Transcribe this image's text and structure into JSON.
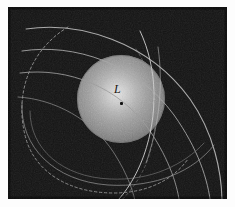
{
  "figure": {
    "kind": "astronomical-diagram",
    "background_color": "#131313",
    "frame_color": "#fdfdfd",
    "sphere": {
      "name": "lunar-sphere",
      "center_x": 121,
      "center_y": 99,
      "radius": 44,
      "fill_color": "#8d8d8d",
      "highlight_color": "#c9c9c9",
      "rim_color": "#5a5a5a"
    },
    "label": {
      "text": "L",
      "x": 106,
      "y": 76,
      "color": "#17150f"
    },
    "center_point": {
      "name": "sphere-center-marker",
      "x": 113,
      "y": 96,
      "color": "#141414"
    },
    "curves": [
      {
        "name": "trajectory-arc-1",
        "style": "solid",
        "stroke": "#b6b6b6",
        "width": 1.1,
        "d": "M 18 22 C 70 14 140 34 182 92 C 206 126 214 166 214 196"
      },
      {
        "name": "trajectory-arc-2",
        "style": "solid",
        "stroke": "#a8a8a8",
        "width": 1.0,
        "d": "M 14 44 C 66 36 128 56 166 108 C 190 142 200 172 203 199"
      },
      {
        "name": "trajectory-arc-3",
        "style": "solid",
        "stroke": "#9e9e9e",
        "width": 1.0,
        "d": "M 12 66 C 60 60 112 80 142 124 C 162 154 170 180 172 199"
      },
      {
        "name": "trajectory-arc-4",
        "style": "solid",
        "stroke": "#8f8f8f",
        "width": 1.0,
        "d": "M 10 90 C 46 92 84 112 106 146 C 120 168 126 186 128 199"
      },
      {
        "name": "sweep-arc-lower",
        "style": "solid",
        "stroke": "#8a8a8a",
        "width": 1.0,
        "d": "M 14 96 C 12 140 46 174 100 178 C 148 181 186 164 206 138"
      },
      {
        "name": "sweep-arc-lower-2",
        "style": "solid",
        "stroke": "#7d7d7d",
        "width": 1.0,
        "d": "M 22 104 C 22 142 54 170 102 172 C 142 174 176 158 196 136"
      },
      {
        "name": "terminator-arc",
        "style": "solid",
        "stroke": "#cfcfcf",
        "width": 1.0,
        "d": "M 132 24 C 150 62 150 108 136 148 C 126 176 112 192 104 199"
      },
      {
        "name": "limb-crossing-arc",
        "style": "solid",
        "stroke": "#c2c2c2",
        "width": 1.0,
        "d": "M 150 40 C 156 82 150 122 138 156"
      },
      {
        "name": "orbit-dashed",
        "style": "dashed",
        "stroke": "#9a9a9a",
        "width": 1.0,
        "dash": "2.5,2.5",
        "d": "M 60 20 C 20 44 6 90 18 132 C 28 166 62 186 106 186 C 140 186 166 172 180 152"
      },
      {
        "name": "orbit-dashed-inner",
        "style": "dashed",
        "stroke": "#8e8e8e",
        "width": 0.9,
        "dash": "2.5,3",
        "d": "M 128 42 C 150 76 152 116 140 152 C 132 174 118 190 108 198"
      }
    ]
  }
}
